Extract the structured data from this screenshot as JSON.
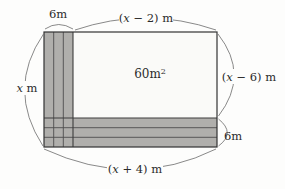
{
  "figure": {
    "type": "geometry-diagram",
    "area_label": {
      "base": "60m",
      "sup": "2"
    },
    "labels": {
      "top_strip_width": "6m",
      "top_width": {
        "pre": "(",
        "var": "x",
        "post": " − 2) m"
      },
      "right_height": {
        "pre": "(",
        "var": "x",
        "post": " − 6) m"
      },
      "left_height": {
        "var": "x",
        "post": " m"
      },
      "bottom_strip_height": "6m",
      "bottom_width": {
        "pre": "(",
        "var": "x",
        "post": " + 4) m"
      }
    },
    "colors": {
      "background": "#fdfdfc",
      "strip_fill": "#b0afac",
      "inner_fill": "#fafaf8",
      "outline": "#333333",
      "leader_line": "#6b6b6b",
      "text": "#2b2b2b"
    }
  }
}
